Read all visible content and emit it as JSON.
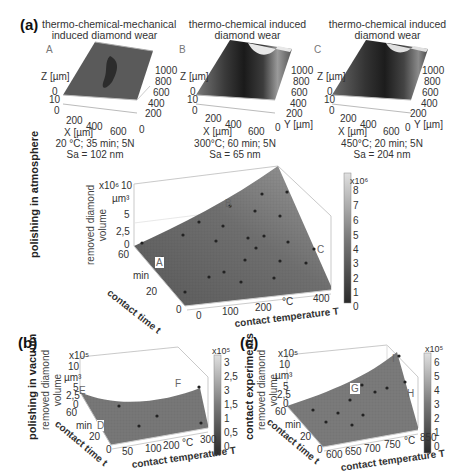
{
  "panel_a": {
    "label": "(a)",
    "row_label": "polishing in atmosphere",
    "thumbnails": [
      {
        "letter": "A",
        "title_line1": "thermo-chemical-mechanical",
        "title_line2": "induced diamond wear",
        "z_label": "Z [µm]",
        "z_ticks": [
          "0",
          "10"
        ],
        "z_zero": "0",
        "x_label": "X [µm]",
        "x_ticks": [
          "200",
          "400",
          "600"
        ],
        "y_label": "Y [µm]",
        "y_ticks": [
          "1000",
          "800",
          "600",
          "400",
          "200",
          "0"
        ],
        "conditions": "20 °C; 35 min; 5N",
        "sa": "Sa = 102 nm"
      },
      {
        "letter": "B",
        "title_line1": "thermo-chemical induced",
        "title_line2": "diamond wear",
        "z_label": "Z [µm]",
        "z_ticks": [
          "0",
          "10"
        ],
        "z_zero": "0",
        "x_label": "X [µm]",
        "x_ticks": [
          "200",
          "400",
          "600"
        ],
        "y_label": "Y [µm]",
        "y_ticks": [
          "1000",
          "800",
          "600",
          "400",
          "200",
          "0"
        ],
        "conditions": "300°C; 60 min; 5N",
        "sa": "Sa = 65 nm"
      },
      {
        "letter": "C",
        "title_line1": "thermo-chemical induced",
        "title_line2": "diamond wear",
        "z_label": "Z [µm]",
        "z_ticks": [
          "0",
          "10"
        ],
        "z_zero": "0",
        "x_label": "X [µm]",
        "x_ticks": [
          "200",
          "400",
          "600"
        ],
        "y_label": "Y [µm]",
        "y_ticks": [
          "1000",
          "800",
          "600",
          "400",
          "200",
          "0"
        ],
        "conditions": "450°C; 20 min; 5N",
        "sa": "Sa = 204 nm"
      }
    ],
    "main": {
      "z_exp": "x10⁶",
      "z_unit": "µm³",
      "z_ticks": [
        "10",
        "5",
        "2,5",
        "0"
      ],
      "z_label_line1": "removed diamond",
      "z_label_line2": "volume",
      "t_ticks": [
        "60",
        "20",
        "0"
      ],
      "t_unit": "min",
      "t_label": "contact time t",
      "T_ticks": [
        "0",
        "100",
        "200",
        "400"
      ],
      "T_unit": "°C",
      "T_label": "contact temperature T",
      "markers": [
        "A",
        "B",
        "C"
      ],
      "colorbar_exp": "x10⁶",
      "colorbar_ticks": [
        "8",
        "7",
        "6",
        "5",
        "4",
        "3",
        "2",
        "1",
        "0"
      ]
    }
  },
  "panel_b": {
    "label": "(b)",
    "row_label": "polishing in vacuum",
    "z_exp": "x10⁵",
    "z_unit": "µm³",
    "z_ticks": [
      "10",
      "5",
      "2,5",
      "0"
    ],
    "z_label_line1": "removed diamond",
    "z_label_line2": "volume",
    "t_ticks": [
      "60",
      "20",
      "0"
    ],
    "t_unit": "min",
    "t_label": "contact time t",
    "T_ticks": [
      "50",
      "100",
      "200",
      "300"
    ],
    "T_unit": "°C",
    "T_label": "contact temperature T",
    "markers": [
      "E",
      "F",
      "D"
    ],
    "colorbar_exp": "x10⁵",
    "colorbar_ticks": [
      "3",
      "2,5",
      "3",
      "1,5",
      "1",
      "0,5",
      "0"
    ]
  },
  "panel_c": {
    "label": "(c)",
    "row_label": "contact experiments",
    "z_exp": "x10⁵",
    "z_unit": "µm³",
    "z_ticks": [
      "10",
      "5",
      "2,5",
      "0"
    ],
    "z_label_line1": "removed diamond",
    "z_label_line2": "volume",
    "t_ticks": [
      "60",
      "20",
      "0"
    ],
    "t_unit": "min",
    "t_label": "contact time t",
    "T_ticks": [
      "600",
      "650",
      "700",
      "750",
      "850"
    ],
    "T_unit": "°C",
    "T_label": "contact temperature T",
    "markers": [
      "G",
      "H",
      "I"
    ],
    "colorbar_exp": "x10⁵",
    "colorbar_ticks": [
      "6",
      "5",
      "4",
      "3",
      "2",
      "1",
      "0"
    ]
  }
}
